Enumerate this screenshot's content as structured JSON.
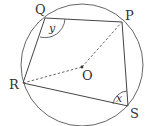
{
  "diagram": {
    "type": "circle-geometry",
    "colors": {
      "stroke": "#555555",
      "background": "#ffffff",
      "text": "#333333"
    },
    "circle": {
      "center_label": "O",
      "cx": 82,
      "cy": 65,
      "r": 61
    },
    "points": {
      "P": {
        "label": "P",
        "x": 122,
        "y": 22
      },
      "Q": {
        "label": "Q",
        "x": 45,
        "y": 18
      },
      "R": {
        "label": "R",
        "x": 23,
        "y": 83
      },
      "S": {
        "label": "S",
        "x": 128,
        "y": 106
      },
      "O": {
        "label": "O",
        "x": 82,
        "y": 67
      }
    },
    "quadrilateral": [
      "P",
      "Q",
      "R",
      "S"
    ],
    "dashed_segments": [
      [
        "R",
        "O"
      ],
      [
        "O",
        "P"
      ]
    ],
    "angles": {
      "at_Q": {
        "label": "y"
      },
      "at_S": {
        "label": "x"
      }
    }
  }
}
